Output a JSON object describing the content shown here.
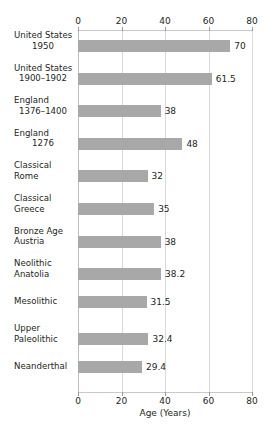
{
  "chart_data": {
    "type": "bar",
    "orientation": "horizontal",
    "title": "",
    "xlabel": "Age (Years)",
    "ylabel": "",
    "xlim": [
      0,
      80
    ],
    "xticks": [
      0,
      20,
      40,
      60,
      80
    ],
    "xtick_labels": [
      "0",
      "20",
      "40",
      "60",
      "80"
    ],
    "grid": true,
    "legend": false,
    "axis_top_ticks": true,
    "axis_bottom_ticks": true,
    "bar_color": "#a8a8a8",
    "gridline_color": "#d9d9d9",
    "text_color": "#231f20",
    "background": "#ffffff",
    "categories": [
      "United States 1950",
      "United States 1900–1902",
      "England 1376–1400",
      "England 1276",
      "Classical Rome",
      "Classical Greece",
      "Bronze Age Austria",
      "Neolithic Anatolia",
      "Mesolithic",
      "Upper Paleolithic",
      "Neanderthal"
    ],
    "values": [
      70,
      61.5,
      38,
      48,
      32,
      35,
      38,
      38.2,
      31.5,
      32.4,
      29.4
    ],
    "value_labels": [
      "70",
      "61.5",
      "38",
      "48",
      "32",
      "35",
      "38",
      "38.2",
      "31.5",
      "32.4",
      "29.4"
    ]
  },
  "rows": [
    {
      "line1": "United States",
      "line2": "1950",
      "line2_centered": true,
      "value": 70,
      "label": "70"
    },
    {
      "line1": "United States",
      "line2": "1900–1902",
      "line2_centered": true,
      "value": 61.5,
      "label": "61.5"
    },
    {
      "line1": "England",
      "line2": "1376–1400",
      "line2_centered": true,
      "value": 38,
      "label": "38"
    },
    {
      "line1": "England",
      "line2": "1276",
      "line2_centered": true,
      "value": 48,
      "label": "48"
    },
    {
      "line1": "Classical",
      "line2": "Rome",
      "line2_centered": false,
      "value": 32,
      "label": "32"
    },
    {
      "line1": "Classical",
      "line2": "Greece",
      "line2_centered": false,
      "value": 35,
      "label": "35"
    },
    {
      "line1": "Bronze Age",
      "line2": "Austria",
      "line2_centered": false,
      "value": 38,
      "label": "38"
    },
    {
      "line1": "Neolithic",
      "line2": "Anatolia",
      "line2_centered": false,
      "value": 38.2,
      "label": "38.2"
    },
    {
      "line1": "Mesolithic",
      "line2": "",
      "line2_centered": false,
      "value": 31.5,
      "label": "31.5"
    },
    {
      "line1": "Upper",
      "line2": "Paleolithic",
      "line2_centered": false,
      "value": 32.4,
      "label": "32.4"
    },
    {
      "line1": "Neanderthal",
      "line2": "",
      "line2_centered": false,
      "value": 29.4,
      "label": "29.4"
    }
  ],
  "axis": {
    "title": "Age (Years)",
    "ticks": [
      "0",
      "20",
      "40",
      "60",
      "80"
    ]
  }
}
